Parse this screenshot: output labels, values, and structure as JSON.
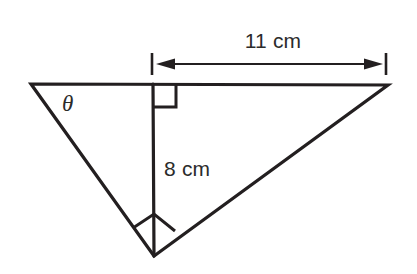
{
  "figure": {
    "background_color": "#ffffff",
    "stroke_color": "#231f20",
    "text_color": "#2b2b2b",
    "labels": {
      "angle": "θ",
      "altitude": "8 cm",
      "top_dimension": "11 cm"
    },
    "icons": {
      "right_angle_top": "right-angle-marker",
      "right_angle_bottom": "right-angle-marker",
      "dimension_arrow": "double-headed-arrow"
    },
    "geometry": {
      "vertices": {
        "left_apex": [
          31,
          84
        ],
        "right_apex": [
          388,
          85
        ],
        "bottom_apex": [
          154,
          256
        ],
        "foot_of_altitude": [
          153,
          84
        ]
      },
      "altitude_length_cm": 8,
      "top_segment_length_cm": 11,
      "dimension_ticks_x": [
        152,
        386
      ],
      "dimension_line_y": 64
    }
  }
}
